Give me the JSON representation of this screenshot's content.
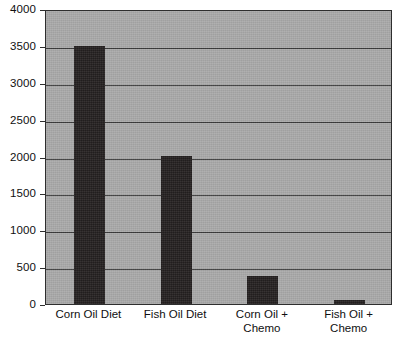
{
  "chart_data": {
    "type": "bar",
    "title": "",
    "subtitle": "",
    "xlabel": "",
    "ylabel": "",
    "categories": [
      "Corn Oil Diet",
      "Fish Oil Diet",
      "Corn Oil +\nChemo",
      "Fish Oil + Chemo"
    ],
    "values": [
      3500,
      2000,
      380,
      60
    ],
    "ylim": [
      0,
      4000
    ],
    "yticks": [
      0,
      500,
      1000,
      1500,
      2000,
      2500,
      3000,
      3500,
      4000
    ],
    "ytick_labels": [
      "0",
      "500",
      "1000",
      "1500",
      "2000",
      "2500",
      "3000",
      "3500",
      "4000"
    ],
    "grid": true,
    "grid_axis": "y",
    "legend": false,
    "legend_position": "none",
    "series": [
      {
        "name": "Tumor size",
        "values": [
          3500,
          2000,
          380,
          60
        ]
      }
    ],
    "annotations": []
  },
  "style": {
    "page_background": "#ffffff",
    "plot_background": "#a9a9a9",
    "bar_color": "#231f1f",
    "gridline_color": "#3a3a3a",
    "axis_color": "#2e2e2e",
    "text_color": "#101010"
  },
  "axis": {
    "y_ticks": [
      {
        "label": "4000",
        "value": 4000
      },
      {
        "label": "3500",
        "value": 3500
      },
      {
        "label": "3000",
        "value": 3000
      },
      {
        "label": "2500",
        "value": 2500
      },
      {
        "label": "2000",
        "value": 2000
      },
      {
        "label": "1500",
        "value": 1500
      },
      {
        "label": "1000",
        "value": 1000
      },
      {
        "label": "500",
        "value": 500
      },
      {
        "label": "0",
        "value": 0
      }
    ],
    "x_ticks": [
      {
        "label": "Corn Oil Diet"
      },
      {
        "label": "Fish Oil Diet"
      },
      {
        "label": "Corn Oil +\nChemo"
      },
      {
        "label": "Fish Oil + Chemo"
      }
    ]
  }
}
